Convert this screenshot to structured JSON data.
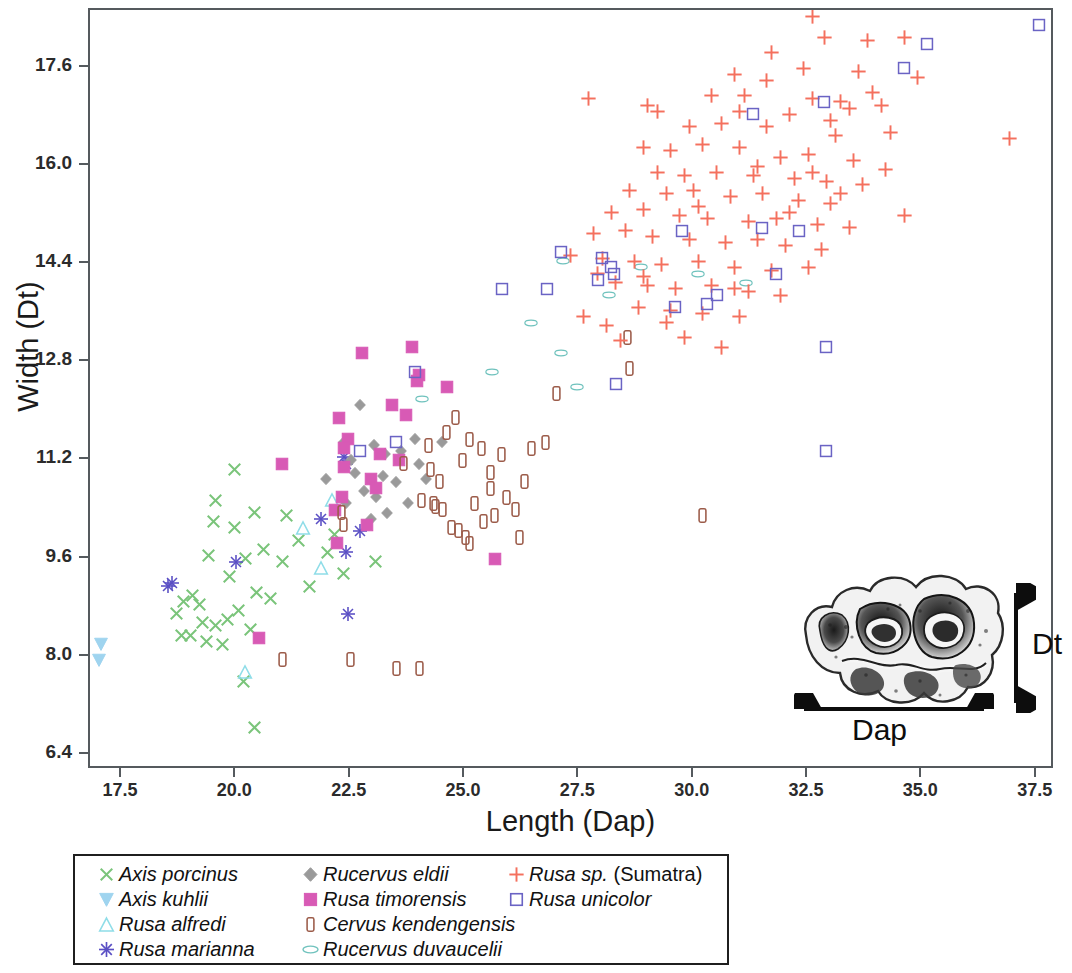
{
  "chart_data": {
    "type": "scatter",
    "title": "",
    "xlabel": "Length (Dap)",
    "ylabel": "Width (Dt)",
    "xlim": [
      16.8,
      37.9
    ],
    "ylim": [
      6.15,
      18.55
    ],
    "xticks": [
      "17.5",
      "20.0",
      "22.5",
      "25.0",
      "27.5",
      "30.0",
      "32.5",
      "35.0",
      "37.5"
    ],
    "xtick_values": [
      17.5,
      20.0,
      22.5,
      25.0,
      27.5,
      30.0,
      32.5,
      35.0,
      37.5
    ],
    "yticks": [
      "6.4",
      "8.0",
      "9.6",
      "11.2",
      "12.8",
      "14.4",
      "16.0",
      "17.6"
    ],
    "ytick_values": [
      6.4,
      8.0,
      9.6,
      11.2,
      12.8,
      14.4,
      16.0,
      17.6
    ],
    "grid": false,
    "legend_position": "below-left",
    "series": [
      {
        "name": "Axis porcinus",
        "marker": "x-cross",
        "color": "#7ac47a",
        "points": [
          [
            19.95,
            11.05
          ],
          [
            19.55,
            10.55
          ],
          [
            19.5,
            10.2
          ],
          [
            20.4,
            10.35
          ],
          [
            19.4,
            9.65
          ],
          [
            20.2,
            9.6
          ],
          [
            21.0,
            9.55
          ],
          [
            20.45,
            9.05
          ],
          [
            19.95,
            10.1
          ],
          [
            21.35,
            9.9
          ],
          [
            22.0,
            9.7
          ],
          [
            18.85,
            8.9
          ],
          [
            19.2,
            8.85
          ],
          [
            19.25,
            8.55
          ],
          [
            19.55,
            8.5
          ],
          [
            19.8,
            8.6
          ],
          [
            19.0,
            8.35
          ],
          [
            19.35,
            8.25
          ],
          [
            19.7,
            8.2
          ],
          [
            18.8,
            8.35
          ],
          [
            20.05,
            8.75
          ],
          [
            20.3,
            8.45
          ],
          [
            20.15,
            7.6
          ],
          [
            20.4,
            6.85
          ],
          [
            22.35,
            9.35
          ],
          [
            21.6,
            9.15
          ],
          [
            18.7,
            8.7
          ],
          [
            19.05,
            9.0
          ],
          [
            19.85,
            9.3
          ],
          [
            20.6,
            9.75
          ],
          [
            21.1,
            10.3
          ],
          [
            22.15,
            10.0
          ],
          [
            23.05,
            9.55
          ],
          [
            20.75,
            8.95
          ]
        ]
      },
      {
        "name": "Axis kuhlii",
        "marker": "triangle-down",
        "color": "#9fd4ef",
        "points": [
          [
            17.05,
            8.2
          ],
          [
            17.0,
            7.95
          ]
        ]
      },
      {
        "name": "Rusa alfredi",
        "marker": "triangle-up",
        "color": "#8fdde8",
        "points": [
          [
            21.45,
            10.1
          ],
          [
            21.85,
            9.45
          ],
          [
            22.1,
            10.55
          ],
          [
            20.2,
            7.75
          ]
        ]
      },
      {
        "name": "Rusa marianna",
        "marker": "asterisk",
        "color": "#5a4fc4",
        "points": [
          [
            22.35,
            11.25
          ],
          [
            22.4,
            11.15
          ],
          [
            18.6,
            9.2
          ],
          [
            18.5,
            9.15
          ],
          [
            20.0,
            9.55
          ],
          [
            21.85,
            10.25
          ],
          [
            22.7,
            10.05
          ],
          [
            22.4,
            9.7
          ],
          [
            22.45,
            8.7
          ]
        ]
      },
      {
        "name": "Rucervus eldii",
        "marker": "diamond",
        "color": "#9a9a9a",
        "points": [
          [
            22.7,
            12.1
          ],
          [
            22.35,
            11.5
          ],
          [
            23.0,
            11.45
          ],
          [
            22.5,
            11.2
          ],
          [
            22.6,
            11.0
          ],
          [
            23.25,
            11.3
          ],
          [
            23.6,
            11.35
          ],
          [
            23.9,
            11.55
          ],
          [
            23.2,
            10.95
          ],
          [
            23.5,
            10.85
          ],
          [
            22.8,
            10.7
          ],
          [
            23.05,
            10.6
          ],
          [
            24.0,
            11.15
          ],
          [
            24.5,
            11.5
          ],
          [
            22.4,
            10.5
          ],
          [
            23.75,
            10.5
          ],
          [
            23.3,
            10.35
          ],
          [
            24.15,
            10.9
          ],
          [
            22.95,
            10.25
          ],
          [
            21.95,
            10.9
          ]
        ]
      },
      {
        "name": "Rusa timorensis",
        "marker": "filled-square",
        "color": "#d85ab5",
        "points": [
          [
            22.75,
            12.95
          ],
          [
            23.85,
            13.05
          ],
          [
            22.45,
            11.55
          ],
          [
            22.35,
            11.4
          ],
          [
            21.0,
            11.15
          ],
          [
            23.7,
            11.95
          ],
          [
            24.0,
            12.6
          ],
          [
            23.95,
            12.5
          ],
          [
            23.4,
            12.1
          ],
          [
            22.35,
            11.1
          ],
          [
            23.15,
            11.3
          ],
          [
            22.95,
            10.9
          ],
          [
            22.3,
            10.6
          ],
          [
            22.15,
            10.4
          ],
          [
            23.55,
            11.2
          ],
          [
            24.6,
            12.4
          ],
          [
            25.65,
            9.6
          ],
          [
            20.5,
            8.3
          ],
          [
            22.2,
            9.85
          ],
          [
            22.85,
            10.15
          ],
          [
            22.25,
            11.9
          ],
          [
            23.05,
            10.75
          ]
        ]
      },
      {
        "name": "Cervus kendengensis",
        "marker": "open-rect",
        "color": "#9c5c4a",
        "points": [
          [
            22.3,
            10.35
          ],
          [
            22.35,
            10.15
          ],
          [
            23.65,
            11.15
          ],
          [
            24.6,
            11.65
          ],
          [
            24.8,
            11.9
          ],
          [
            24.25,
            11.05
          ],
          [
            24.45,
            10.85
          ],
          [
            25.1,
            11.55
          ],
          [
            24.95,
            11.2
          ],
          [
            25.35,
            11.4
          ],
          [
            25.55,
            11.0
          ],
          [
            25.8,
            11.3
          ],
          [
            24.05,
            10.55
          ],
          [
            24.3,
            10.5
          ],
          [
            24.35,
            10.45
          ],
          [
            24.5,
            10.4
          ],
          [
            25.2,
            10.5
          ],
          [
            25.4,
            10.2
          ],
          [
            25.9,
            10.6
          ],
          [
            26.1,
            10.4
          ],
          [
            24.7,
            10.1
          ],
          [
            24.85,
            10.05
          ],
          [
            25.0,
            9.95
          ],
          [
            25.1,
            9.85
          ],
          [
            26.2,
            9.95
          ],
          [
            25.65,
            10.3
          ],
          [
            26.45,
            11.4
          ],
          [
            27.0,
            12.3
          ],
          [
            22.5,
            7.95
          ],
          [
            23.5,
            7.8
          ],
          [
            24.0,
            7.8
          ],
          [
            21.0,
            7.95
          ],
          [
            30.2,
            10.3
          ],
          [
            28.6,
            12.7
          ],
          [
            28.55,
            13.2
          ],
          [
            26.75,
            11.5
          ],
          [
            24.2,
            11.45
          ],
          [
            25.55,
            10.75
          ],
          [
            26.3,
            10.85
          ]
        ]
      },
      {
        "name": "Rucervus duvaucelii",
        "marker": "ellipse",
        "color": "#6fc2bd",
        "points": [
          [
            24.05,
            12.2
          ],
          [
            25.6,
            12.65
          ],
          [
            27.1,
            12.95
          ],
          [
            27.45,
            12.4
          ],
          [
            27.15,
            14.45
          ],
          [
            28.85,
            14.35
          ],
          [
            30.1,
            14.25
          ],
          [
            28.15,
            13.9
          ],
          [
            31.15,
            14.1
          ],
          [
            26.45,
            13.45
          ]
        ]
      },
      {
        "name": "Rusa sp. (Sumatra)",
        "marker": "plus",
        "color": "#f4705e",
        "points": [
          [
            32.6,
            18.45
          ],
          [
            32.85,
            18.1
          ],
          [
            33.8,
            18.05
          ],
          [
            34.6,
            18.1
          ],
          [
            31.7,
            17.85
          ],
          [
            32.4,
            17.6
          ],
          [
            30.9,
            17.5
          ],
          [
            33.6,
            17.55
          ],
          [
            34.9,
            17.45
          ],
          [
            27.7,
            17.1
          ],
          [
            30.4,
            17.15
          ],
          [
            29.0,
            17.0
          ],
          [
            31.1,
            17.15
          ],
          [
            32.6,
            17.1
          ],
          [
            33.2,
            17.05
          ],
          [
            33.4,
            16.95
          ],
          [
            32.1,
            16.85
          ],
          [
            29.9,
            16.65
          ],
          [
            30.6,
            16.7
          ],
          [
            31.6,
            16.65
          ],
          [
            33.1,
            16.5
          ],
          [
            34.3,
            16.55
          ],
          [
            36.9,
            16.45
          ],
          [
            28.9,
            16.3
          ],
          [
            29.5,
            16.25
          ],
          [
            30.2,
            16.35
          ],
          [
            31.0,
            16.3
          ],
          [
            31.9,
            16.15
          ],
          [
            32.5,
            16.2
          ],
          [
            33.5,
            16.1
          ],
          [
            34.2,
            15.95
          ],
          [
            29.2,
            15.9
          ],
          [
            29.8,
            15.85
          ],
          [
            30.5,
            15.9
          ],
          [
            31.3,
            15.85
          ],
          [
            32.2,
            15.8
          ],
          [
            32.9,
            15.75
          ],
          [
            33.7,
            15.7
          ],
          [
            28.6,
            15.6
          ],
          [
            29.4,
            15.55
          ],
          [
            30.0,
            15.6
          ],
          [
            30.8,
            15.5
          ],
          [
            31.5,
            15.55
          ],
          [
            32.3,
            15.45
          ],
          [
            33.0,
            15.4
          ],
          [
            34.6,
            15.2
          ],
          [
            28.2,
            15.25
          ],
          [
            28.9,
            15.3
          ],
          [
            29.7,
            15.2
          ],
          [
            30.3,
            15.15
          ],
          [
            31.2,
            15.1
          ],
          [
            31.8,
            15.15
          ],
          [
            32.7,
            15.05
          ],
          [
            33.4,
            15.0
          ],
          [
            27.8,
            14.9
          ],
          [
            28.5,
            14.95
          ],
          [
            29.1,
            14.85
          ],
          [
            29.9,
            14.8
          ],
          [
            30.7,
            14.75
          ],
          [
            31.4,
            14.8
          ],
          [
            32.0,
            14.7
          ],
          [
            32.8,
            14.65
          ],
          [
            27.3,
            14.55
          ],
          [
            28.0,
            14.5
          ],
          [
            28.7,
            14.45
          ],
          [
            29.3,
            14.4
          ],
          [
            30.1,
            14.45
          ],
          [
            30.9,
            14.35
          ],
          [
            31.7,
            14.3
          ],
          [
            32.5,
            14.35
          ],
          [
            28.3,
            14.1
          ],
          [
            29.0,
            14.05
          ],
          [
            29.6,
            14.0
          ],
          [
            30.4,
            14.05
          ],
          [
            31.2,
            13.95
          ],
          [
            31.9,
            13.9
          ],
          [
            28.8,
            13.7
          ],
          [
            29.5,
            13.65
          ],
          [
            30.2,
            13.6
          ],
          [
            31.0,
            13.55
          ],
          [
            27.6,
            13.55
          ],
          [
            28.1,
            13.4
          ],
          [
            29.8,
            13.2
          ],
          [
            30.6,
            13.05
          ],
          [
            32.1,
            15.25
          ],
          [
            33.0,
            16.75
          ],
          [
            31.4,
            16.0
          ],
          [
            30.1,
            15.35
          ],
          [
            28.9,
            14.2
          ],
          [
            29.4,
            13.45
          ],
          [
            30.9,
            14.0
          ],
          [
            32.6,
            15.9
          ],
          [
            33.9,
            17.2
          ],
          [
            31.0,
            16.9
          ],
          [
            29.2,
            16.9
          ],
          [
            31.6,
            17.4
          ],
          [
            28.4,
            13.15
          ],
          [
            27.9,
            14.25
          ],
          [
            33.2,
            15.55
          ],
          [
            34.1,
            17.0
          ]
        ]
      },
      {
        "name": "Rusa unicolor",
        "marker": "open-square",
        "color": "#6a63c4",
        "points": [
          [
            37.55,
            18.3
          ],
          [
            35.1,
            18.0
          ],
          [
            34.6,
            17.6
          ],
          [
            32.85,
            17.05
          ],
          [
            31.3,
            16.85
          ],
          [
            22.7,
            11.35
          ],
          [
            23.9,
            12.65
          ],
          [
            23.5,
            11.5
          ],
          [
            27.1,
            14.6
          ],
          [
            28.0,
            14.5
          ],
          [
            28.2,
            14.35
          ],
          [
            28.25,
            14.25
          ],
          [
            25.8,
            14.0
          ],
          [
            26.8,
            14.0
          ],
          [
            29.75,
            14.95
          ],
          [
            31.5,
            15.0
          ],
          [
            32.3,
            14.95
          ],
          [
            31.8,
            14.25
          ],
          [
            30.5,
            13.9
          ],
          [
            29.6,
            13.7
          ],
          [
            30.3,
            13.75
          ],
          [
            28.3,
            12.45
          ],
          [
            32.9,
            13.05
          ],
          [
            32.9,
            11.35
          ],
          [
            27.9,
            14.15
          ]
        ]
      }
    ]
  },
  "inset": {
    "label_vertical": "Dt",
    "label_horizontal": "Dap",
    "alt": "molar tooth occlusal view"
  },
  "legend": {
    "columns": [
      {
        "left": 18,
        "items": [
          {
            "label": "Axis porcinus",
            "marker": "x-cross",
            "color": "#7ac47a"
          },
          {
            "label": "Axis kuhlii",
            "marker": "triangle-down",
            "color": "#9fd4ef"
          },
          {
            "label": "Rusa alfredi",
            "marker": "triangle-up",
            "color": "#8fdde8"
          },
          {
            "label": "Rusa marianna",
            "marker": "asterisk",
            "color": "#5a4fc4"
          }
        ]
      },
      {
        "left": 222,
        "items": [
          {
            "label": "Rucervus eldii",
            "marker": "diamond",
            "color": "#9a9a9a"
          },
          {
            "label": "Rusa timorensis",
            "marker": "filled-square",
            "color": "#d85ab5"
          },
          {
            "label": "Cervus kendengensis",
            "marker": "open-rect",
            "color": "#9c5c4a"
          },
          {
            "label": "Rucervus duvaucelii",
            "marker": "ellipse",
            "color": "#6fc2bd"
          }
        ]
      },
      {
        "left": 428,
        "items": [
          {
            "label": "Rusa sp. ",
            "label_roman": "(Sumatra)",
            "marker": "plus",
            "color": "#f4705e"
          },
          {
            "label": "Rusa unicolor",
            "marker": "open-square",
            "color": "#6a63c4"
          }
        ]
      }
    ]
  }
}
